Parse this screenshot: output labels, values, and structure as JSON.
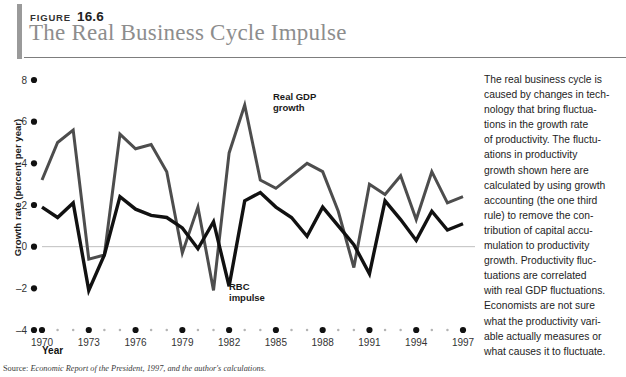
{
  "header": {
    "figure_word": "FIGURE",
    "figure_number": "16.6",
    "title": "The Real Business Cycle Impulse"
  },
  "axes": {
    "ylabel": "Growth rate (percent per year)",
    "xlabel": "Year"
  },
  "source": {
    "prefix": "Source:",
    "text": "Economic Report of the President, 1997, and the author's calculations."
  },
  "caption": {
    "lines": [
      "The real business cycle is",
      "caused by changes in tech-",
      "nology that bring fluctua-",
      "tions in the growth rate",
      "of productivity. The fluctu-",
      "ations in productivity",
      "growth shown here are",
      "calculated by using growth",
      "accounting (the one third",
      "rule) to remove the con-",
      "tribution of capital accu-",
      "mulation to productivity",
      "growth. Productivity fluc-",
      "tuations are correlated",
      "with real GDP fluctuations.",
      "Economists are not sure",
      "what the productivity vari-",
      "able actually measures or",
      "what causes it to fluctuate."
    ]
  },
  "chart_data": {
    "type": "line",
    "title": "The Real Business Cycle Impulse",
    "xlabel": "Year",
    "ylabel": "Growth rate (percent per year)",
    "xlim": [
      1970,
      1997
    ],
    "ylim": [
      -4,
      8
    ],
    "yticks": [
      -4,
      -2,
      0,
      2,
      4,
      6,
      8
    ],
    "xticks": [
      1970,
      1973,
      1976,
      1979,
      1982,
      1985,
      1988,
      1991,
      1994,
      1997
    ],
    "xtick_minor_step": 1,
    "grid": false,
    "zero_line": true,
    "colors": {
      "real_gdp": "#4d4d4d",
      "rbc": "#111111",
      "zero_line": "#bfbfbf"
    },
    "x": [
      1970,
      1971,
      1972,
      1973,
      1974,
      1975,
      1976,
      1977,
      1978,
      1979,
      1980,
      1981,
      1982,
      1983,
      1984,
      1985,
      1986,
      1987,
      1988,
      1989,
      1990,
      1991,
      1992,
      1993,
      1994,
      1995,
      1996,
      1997
    ],
    "series": [
      {
        "name": "Real GDP growth",
        "label": "Real GDP\ngrowth",
        "label_line1": "Real GDP",
        "label_line2": "growth",
        "color": "#4d4d4d",
        "values": [
          3.2,
          5.0,
          5.6,
          -0.6,
          -0.4,
          5.4,
          4.7,
          4.9,
          3.6,
          -0.3,
          1.9,
          -2.1,
          4.5,
          6.8,
          3.2,
          2.8,
          3.4,
          4.0,
          3.6,
          1.7,
          -1.0,
          3.0,
          2.5,
          3.4,
          1.3,
          3.6,
          2.1,
          2.4
        ]
      },
      {
        "name": "RBC impulse",
        "label": "RBC\nimpulse",
        "label_line1": "RBC",
        "label_line2": "impulse",
        "color": "#111111",
        "values": [
          1.9,
          1.4,
          2.1,
          -2.1,
          -0.4,
          2.4,
          1.8,
          1.5,
          1.4,
          0.9,
          -0.1,
          1.2,
          -1.9,
          2.2,
          2.6,
          1.9,
          1.4,
          0.5,
          1.9,
          1.0,
          0.1,
          -1.3,
          2.2,
          1.3,
          0.3,
          1.7,
          0.8,
          1.1
        ]
      }
    ]
  }
}
